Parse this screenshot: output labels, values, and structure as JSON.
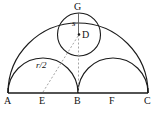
{
  "figure": {
    "stroke_color": "#1a1a1a",
    "dash_color": "#8a8a8a",
    "background": "#ffffff"
  },
  "points": {
    "A": {
      "label": "A",
      "x": 8,
      "y": 93
    },
    "E": {
      "label": "E",
      "x": 43,
      "y": 93
    },
    "B": {
      "label": "B",
      "x": 78,
      "y": 93
    },
    "F": {
      "label": "F",
      "x": 113,
      "y": 93
    },
    "C": {
      "label": "C",
      "x": 148,
      "y": 93
    },
    "G": {
      "label": "G",
      "x": 78,
      "y": 13
    },
    "D": {
      "label": "D",
      "x": 79,
      "y": 35
    }
  },
  "segments": {
    "radius_small": {
      "label": "s"
    },
    "radius_half": {
      "label": "r/2"
    }
  },
  "shapes": {
    "large_semicircle": "semicircle on AC",
    "left_semicircle": "semicircle on AB",
    "right_semicircle": "semicircle on BC",
    "inscribed_circle": "circle centered at D through G",
    "baseline": "segment AC"
  }
}
